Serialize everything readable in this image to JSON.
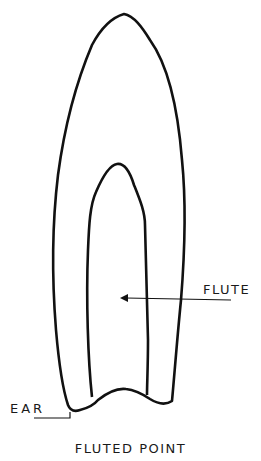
{
  "diagram": {
    "caption": "FLUTED POINT",
    "labels": {
      "flute": "FLUTE",
      "ear": "EAR"
    },
    "colors": {
      "line": "#111111",
      "background": "#ffffff"
    }
  }
}
